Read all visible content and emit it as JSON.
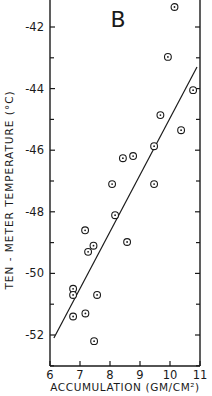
{
  "chart_data": {
    "type": "scatter",
    "title": "",
    "panel_label": "B",
    "xlabel": "ACCUMULATION (GM/CM²)",
    "ylabel": "TEN - METER TEMPERATURE (°C)",
    "xlim": [
      6,
      11
    ],
    "ylim": [
      -53,
      -41
    ],
    "x_ticks": [
      6,
      7,
      8,
      9,
      10,
      11
    ],
    "y_ticks": [
      -42,
      -44,
      -46,
      -48,
      -50,
      -52
    ],
    "grid": false,
    "legend": null,
    "series": [
      {
        "name": "observations",
        "marker": "circled-dot",
        "points": [
          {
            "x": 10.15,
            "y": -41.35
          },
          {
            "x": 9.93,
            "y": -42.97
          },
          {
            "x": 10.77,
            "y": -44.05
          },
          {
            "x": 9.68,
            "y": -44.86
          },
          {
            "x": 10.37,
            "y": -45.35
          },
          {
            "x": 9.47,
            "y": -45.87
          },
          {
            "x": 8.43,
            "y": -46.26
          },
          {
            "x": 8.77,
            "y": -46.19
          },
          {
            "x": 8.07,
            "y": -47.1
          },
          {
            "x": 9.47,
            "y": -47.1
          },
          {
            "x": 8.17,
            "y": -48.11
          },
          {
            "x": 8.57,
            "y": -48.98
          },
          {
            "x": 7.17,
            "y": -48.6
          },
          {
            "x": 7.45,
            "y": -49.1
          },
          {
            "x": 7.27,
            "y": -49.3
          },
          {
            "x": 6.77,
            "y": -50.5
          },
          {
            "x": 6.77,
            "y": -50.7
          },
          {
            "x": 7.57,
            "y": -50.7
          },
          {
            "x": 6.77,
            "y": -51.4
          },
          {
            "x": 7.18,
            "y": -51.3
          },
          {
            "x": 7.47,
            "y": -52.2
          }
        ]
      },
      {
        "name": "regression line",
        "type": "line",
        "points": [
          {
            "x": 6.13,
            "y": -52.1
          },
          {
            "x": 10.9,
            "y": -43.3
          }
        ]
      }
    ]
  }
}
